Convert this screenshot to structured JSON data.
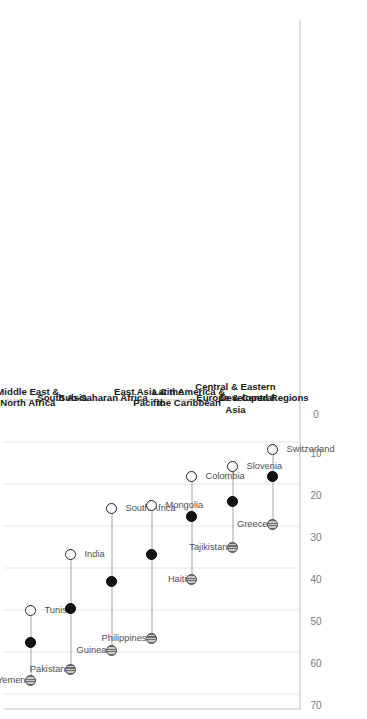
{
  "chart_data": {
    "type": "scatter",
    "title": "",
    "subtitle": "",
    "xlabel": "",
    "ylabel": "",
    "orientation": "rotated-90",
    "value_axis": {
      "ticks": [
        70,
        60,
        50,
        40,
        30,
        20,
        10,
        0
      ],
      "tick_labels": [
        "70",
        "60",
        "50",
        "40",
        "30",
        "20",
        "10",
        "0"
      ],
      "range": [
        0,
        70
      ],
      "direction": "descending-left-to-right",
      "grid": true
    },
    "legend": {
      "position": "none",
      "entries": []
    },
    "series": [
      {
        "name": "highest-country",
        "marker": "striped-gray-circle"
      },
      {
        "name": "regional-average",
        "marker": "solid-black-circle"
      },
      {
        "name": "lowest-country",
        "marker": "open-white-circle"
      }
    ],
    "categories": [
      "Middle East & North Africa",
      "South Asia",
      "Sub-Saharan Africa",
      "East Asia & the Pacific",
      "Latin America & the Caribbean",
      "Central & Eastern Europe & Central Asia",
      "Developed Regions"
    ],
    "groups": [
      {
        "region": "Middle East &\nNorth Africa",
        "high": {
          "label": "Yemen",
          "value": 64.0
        },
        "avg": {
          "label": "",
          "value": 55.0
        },
        "low": {
          "label": "Tunisia",
          "value": 47.5
        }
      },
      {
        "region": "South Asia",
        "high": {
          "label": "Pakistan",
          "value": 61.5
        },
        "avg": {
          "label": "",
          "value": 47.0
        },
        "low": {
          "label": "India",
          "value": 34.0
        }
      },
      {
        "region": "Sub-Saharan Africa",
        "high": {
          "label": "Guinea",
          "value": 57.0
        },
        "avg": {
          "label": "",
          "value": 40.5
        },
        "low": {
          "label": "South Africa",
          "value": 23.0
        }
      },
      {
        "region": "East Asia & the\nPacific",
        "high": {
          "label": "Philippines",
          "value": 54.0
        },
        "avg": {
          "label": "",
          "value": 34.0
        },
        "low": {
          "label": "Mongolia",
          "value": 22.5
        }
      },
      {
        "region": "Latin America &\nthe Caribbean",
        "high": {
          "label": "Haiti",
          "value": 40.0
        },
        "avg": {
          "label": "",
          "value": 25.0
        },
        "low": {
          "label": "Colombia",
          "value": 15.5
        }
      },
      {
        "region": "Central & Eastern\nEurope & Central\nAsia",
        "high": {
          "label": "Tajikistan",
          "value": 32.5
        },
        "avg": {
          "label": "",
          "value": 21.5
        },
        "low": {
          "label": "Slovenia",
          "value": 13.0
        }
      },
      {
        "region": "Developed Regions",
        "high": {
          "label": "Greece",
          "value": 27.0
        },
        "avg": {
          "label": "",
          "value": 15.5
        },
        "low": {
          "label": "Switzerland",
          "value": 9.0
        }
      }
    ]
  }
}
